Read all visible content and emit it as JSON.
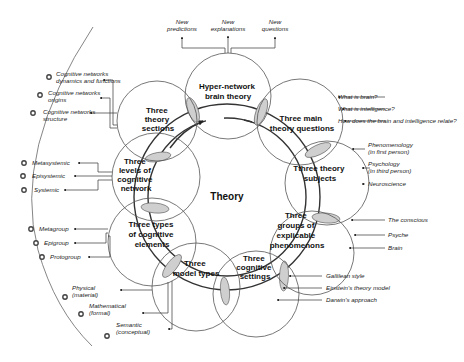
{
  "center": {
    "label": "Theory"
  },
  "top_outputs": [
    {
      "line1": "New",
      "line2": "predictions"
    },
    {
      "line1": "New",
      "line2": "explanations"
    },
    {
      "line1": "New",
      "line2": "questions"
    }
  ],
  "nodes": {
    "hyper": [
      "Hyper-network",
      "brain theory"
    ],
    "questions": [
      "Three main",
      "theory questions"
    ],
    "subjects": [
      "Tthree theory",
      "subjects"
    ],
    "groups": [
      "Three",
      "groups of",
      "explicable",
      "phenomenons"
    ],
    "settings": [
      "Three",
      "cognitive",
      "settings"
    ],
    "models": [
      "Three",
      "model types"
    ],
    "elements": [
      "Three types",
      "of cognitive",
      "elements"
    ],
    "levels": [
      "Three",
      "levels of",
      "cognitive",
      "network"
    ],
    "sections": [
      "Three",
      "theory",
      "sections"
    ]
  },
  "right_labels": {
    "questions": [
      "What is brain?",
      "What is intelligence?",
      "How does the brain and intelligence relate?"
    ],
    "subjects": [
      [
        "Phenomenology",
        "(in first person)"
      ],
      [
        "Psychology",
        "(in third person)"
      ],
      [
        "Neuroscience"
      ]
    ],
    "groups": [
      "The conscious",
      "Psyche",
      "Brain"
    ],
    "settings": [
      "Gallilean style",
      "Einstein's theory model",
      "Darwin's approach"
    ]
  },
  "left_labels": {
    "sections": [
      [
        "Cognitive networks",
        "dynamics and functions"
      ],
      [
        "Cognitive networks",
        "origins"
      ],
      [
        "Cognitive networks",
        "structure"
      ]
    ],
    "levels": [
      "Metasystemic",
      "Episystemic",
      "Systemic"
    ],
    "elements": [
      "Metagroup",
      "Epigroup",
      "Protogroup"
    ],
    "models": [
      [
        "Physical",
        "(material)"
      ],
      [
        "Mathematical",
        "(formal)"
      ],
      [
        "Semantic",
        "(conceptual)"
      ]
    ]
  },
  "colors": {
    "lens_fill": "#cfcfcf",
    "stroke": "#555555",
    "text": "#111111"
  }
}
